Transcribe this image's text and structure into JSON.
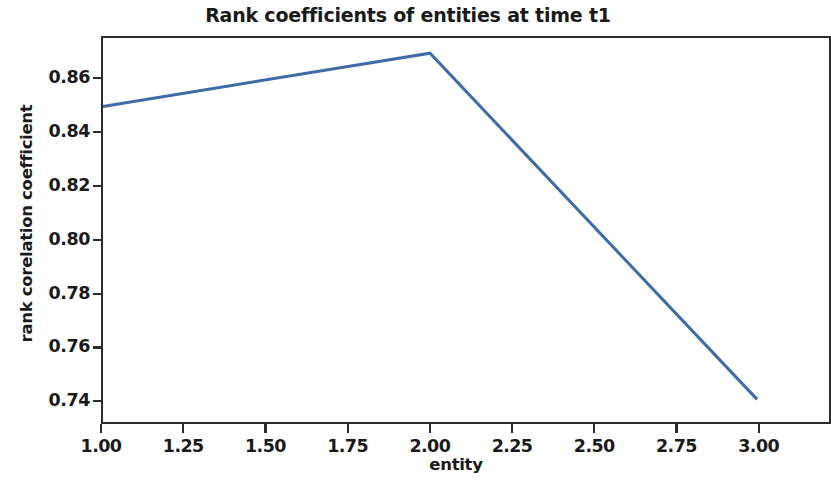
{
  "chart_data": {
    "type": "line",
    "title": "Rank coefficients of entities at time t1",
    "xlabel": "entity",
    "ylabel": "rank corelation coefficient",
    "x": [
      1.0,
      2.0,
      3.0
    ],
    "values": [
      0.85,
      0.87,
      0.74
    ],
    "series": [
      {
        "name": "rank corelation coefficient",
        "x": [
          1.0,
          2.0,
          3.0
        ],
        "values": [
          0.85,
          0.87,
          0.74
        ],
        "color": "#3f6ba8",
        "linewidth": 3.0,
        "marker": "none"
      }
    ],
    "xlim": [
      1.0,
      3.22
    ],
    "ylim": [
      0.7315,
      0.8757
    ],
    "xticks": [
      1.0,
      1.25,
      1.5,
      1.75,
      2.0,
      2.25,
      2.5,
      2.75,
      3.0
    ],
    "xtick_labels": [
      "1.00",
      "1.25",
      "1.50",
      "1.75",
      "2.00",
      "2.25",
      "2.50",
      "2.75",
      "3.00"
    ],
    "yticks": [
      0.86,
      0.84,
      0.82,
      0.8,
      0.78,
      0.76,
      0.74
    ],
    "ytick_labels": [
      "0.86",
      "0.84",
      "0.82",
      "0.80",
      "0.78",
      "0.76",
      "0.74"
    ],
    "grid": false,
    "legend": false,
    "legend_position": "none"
  },
  "figure": {
    "background_color": "#ffffff",
    "axes_edge_color": "#2b2b2b",
    "text_color": "#1a1a1a"
  }
}
